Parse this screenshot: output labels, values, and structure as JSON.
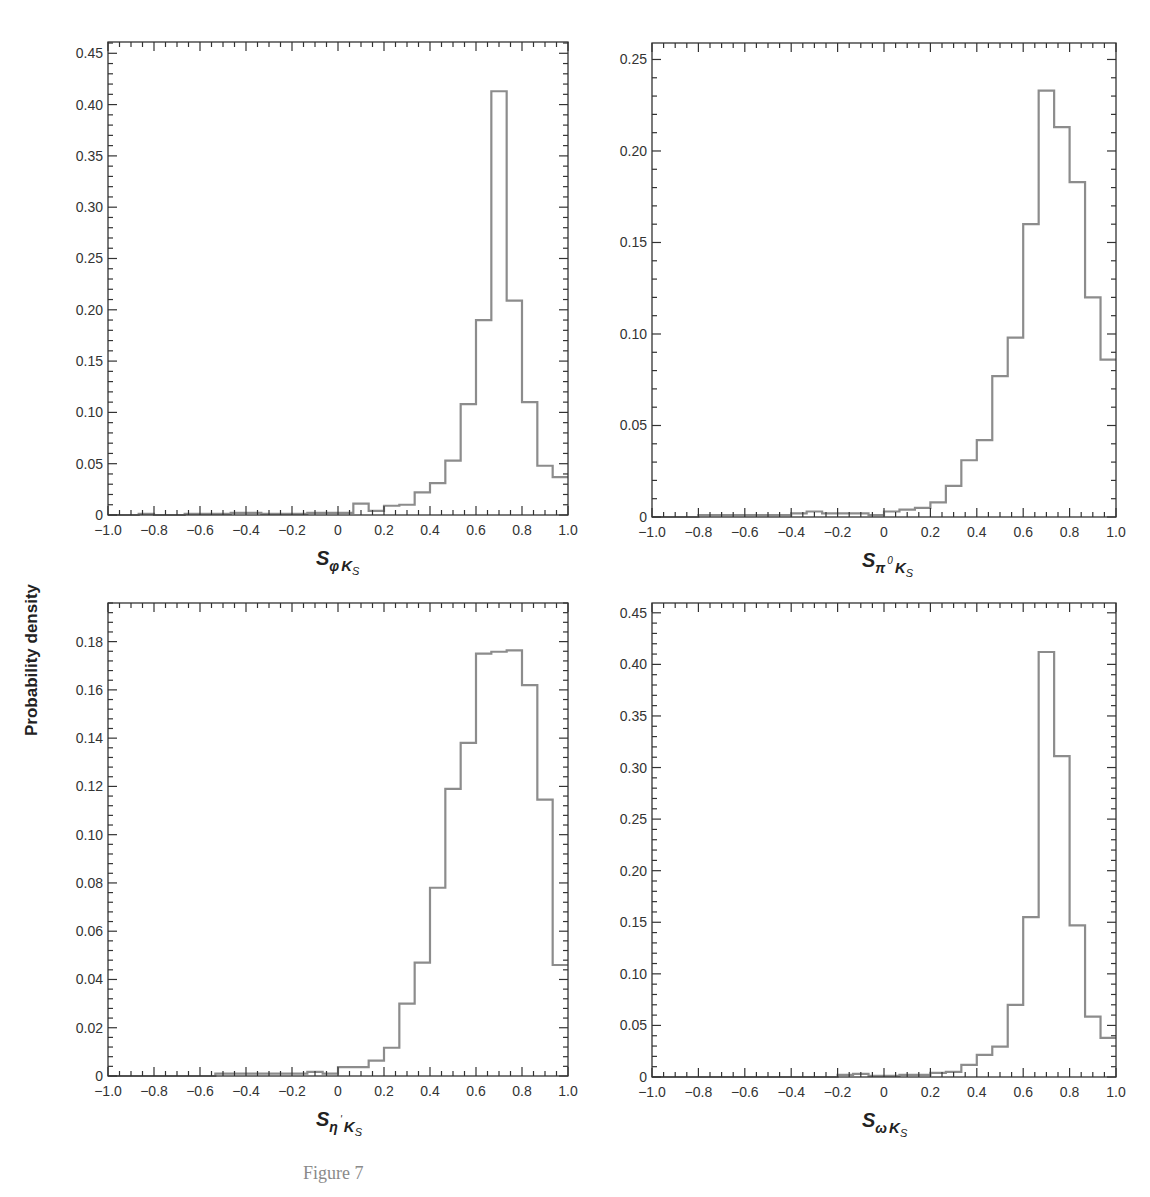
{
  "figure": {
    "y_axis_label": "Probability density",
    "caption": "Figure 7"
  },
  "chart_data": [
    {
      "type": "histogram",
      "panel": "top-left",
      "xlabel": "S_{φK_S}",
      "xlabel_parts": {
        "main": "S",
        "sub": "φ",
        "sub2": "K",
        "sub3": "S"
      },
      "ylabel": "Probability density",
      "xlim": [
        -1.0,
        1.0
      ],
      "ylim": [
        0,
        0.461
      ],
      "x_ticks": [
        "−1.0",
        "−0.8",
        "−0.6",
        "−0.4",
        "−0.2",
        "0",
        "0.2",
        "0.4",
        "0.6",
        "0.8",
        "1.0"
      ],
      "y_ticks": [
        "0",
        "0.05",
        "0.10",
        "0.15",
        "0.20",
        "0.25",
        "0.30",
        "0.35",
        "0.40",
        "0.45"
      ],
      "y_tick_values": [
        0,
        0.05,
        0.1,
        0.15,
        0.2,
        0.25,
        0.3,
        0.35,
        0.4,
        0.45
      ],
      "bin_edges_start": -1.0,
      "bin_width": 0.0667,
      "values": [
        0,
        0,
        0.001,
        0,
        0,
        0.001,
        0.001,
        0.001,
        0.002,
        0.002,
        0.001,
        0.001,
        0.001,
        0.002,
        0.002,
        0.002,
        0.011,
        0.004,
        0.009,
        0.01,
        0.022,
        0.031,
        0.053,
        0.108,
        0.19,
        0.413,
        0.209,
        0.11,
        0.048,
        0.037
      ],
      "box": {
        "left": 108,
        "top": 42,
        "right": 568,
        "bottom": 515
      }
    },
    {
      "type": "histogram",
      "panel": "top-right",
      "xlabel": "S_{π0K_S}",
      "xlabel_parts": {
        "main": "S",
        "sub": "π",
        "sup": "0",
        "sub2": "K",
        "sub3": "S"
      },
      "ylabel": "Probability density",
      "xlim": [
        -1.0,
        1.0
      ],
      "ylim": [
        0,
        0.259
      ],
      "x_ticks": [
        "−1.0",
        "−0.8",
        "−0.6",
        "−0.4",
        "−0.2",
        "0",
        "0.2",
        "0.4",
        "0.6",
        "0.8",
        "1.0"
      ],
      "y_ticks": [
        "0",
        "0.05",
        "0.10",
        "0.15",
        "0.20",
        "0.25"
      ],
      "y_tick_values": [
        0,
        0.05,
        0.1,
        0.15,
        0.2,
        0.25
      ],
      "bin_edges_start": -1.0,
      "bin_width": 0.0667,
      "values": [
        0,
        0,
        0,
        0.001,
        0.001,
        0.001,
        0.001,
        0.001,
        0.001,
        0.002,
        0.003,
        0.002,
        0.002,
        0.002,
        0.001,
        0.003,
        0.004,
        0.005,
        0.008,
        0.017,
        0.031,
        0.042,
        0.077,
        0.098,
        0.16,
        0.233,
        0.213,
        0.183,
        0.12,
        0.086
      ],
      "box": {
        "left": 652,
        "top": 43,
        "right": 1116,
        "bottom": 517
      }
    },
    {
      "type": "histogram",
      "panel": "bottom-left",
      "xlabel": "S_{η'K_S}",
      "xlabel_parts": {
        "main": "S",
        "sub": "η",
        "sup": "'",
        "sub2": "K",
        "sub3": "S"
      },
      "ylabel": "Probability density",
      "xlim": [
        -1.0,
        1.0
      ],
      "ylim": [
        0,
        0.196
      ],
      "x_ticks": [
        "−1.0",
        "−0.8",
        "−0.6",
        "−0.4",
        "−0.2",
        "0",
        "0.2",
        "0.4",
        "0.6",
        "0.8",
        "1.0"
      ],
      "y_ticks": [
        "0",
        "0.02",
        "0.04",
        "0.06",
        "0.08",
        "0.10",
        "0.12",
        "0.14",
        "0.16",
        "0.18"
      ],
      "y_tick_values": [
        0,
        0.02,
        0.04,
        0.06,
        0.08,
        0.1,
        0.12,
        0.14,
        0.16,
        0.18
      ],
      "bin_edges_start": -1.0,
      "bin_width": 0.0667,
      "values": [
        0,
        0,
        0,
        0,
        0,
        0,
        0,
        0.001,
        0.001,
        0.001,
        0.001,
        0.001,
        0.001,
        0.0017,
        0.001,
        0.0037,
        0.0037,
        0.0064,
        0.0117,
        0.03,
        0.047,
        0.078,
        0.119,
        0.138,
        0.175,
        0.1758,
        0.1764,
        0.162,
        0.1145,
        0.046
      ],
      "box": {
        "left": 108,
        "top": 603,
        "right": 568,
        "bottom": 1076
      }
    },
    {
      "type": "histogram",
      "panel": "bottom-right",
      "xlabel": "S_{ωK_S}",
      "xlabel_parts": {
        "main": "S",
        "sub": "ω",
        "sub2": "K",
        "sub3": "S"
      },
      "ylabel": "Probability density",
      "xlim": [
        -1.0,
        1.0
      ],
      "ylim": [
        0,
        0.4595
      ],
      "x_ticks": [
        "−1.0",
        "−0.8",
        "−0.6",
        "−0.4",
        "−0.2",
        "0",
        "0.2",
        "0.4",
        "0.6",
        "0.8",
        "1.0"
      ],
      "y_ticks": [
        "0",
        "0.05",
        "0.10",
        "0.15",
        "0.20",
        "0.25",
        "0.30",
        "0.35",
        "0.40",
        "0.45"
      ],
      "y_tick_values": [
        0,
        0.05,
        0.1,
        0.15,
        0.2,
        0.25,
        0.3,
        0.35,
        0.4,
        0.45
      ],
      "bin_edges_start": -1.0,
      "bin_width": 0.0667,
      "values": [
        0,
        0,
        0,
        0,
        0,
        0,
        0,
        0,
        0,
        0,
        0,
        0,
        0.002,
        0.003,
        0.001,
        0.001,
        0.002,
        0.002,
        0.004,
        0.005,
        0.0117,
        0.0214,
        0.0295,
        0.07,
        0.155,
        0.412,
        0.311,
        0.147,
        0.0586,
        0.038
      ],
      "box": {
        "left": 652,
        "top": 603,
        "right": 1116,
        "bottom": 1077
      }
    }
  ],
  "style": {
    "axis_color": "#333333",
    "histogram_color": "#8c8c8c",
    "tick_label_color": "#333333",
    "caption_color": "#8a8a8a"
  }
}
